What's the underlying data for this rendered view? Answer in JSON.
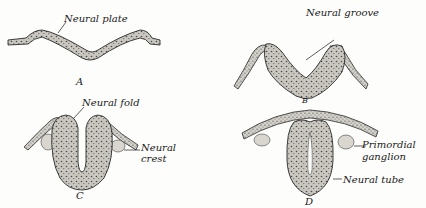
{
  "figures": [
    {
      "id": "A",
      "letter": "A",
      "labels": [
        "Neural plate"
      ]
    },
    {
      "id": "B",
      "letter": "B",
      "labels": [
        "Neural groove"
      ]
    },
    {
      "id": "C",
      "letter": "C",
      "labels": [
        "Neural fold",
        "Neural",
        "crest"
      ]
    },
    {
      "id": "D",
      "letter": "D",
      "labels": [
        "Primordial",
        "ganglion",
        "Neural tube"
      ]
    }
  ],
  "colors": {
    "tissue": "#b9b7b0",
    "outline": "#2a2a2a",
    "ink": "#1a1a1a"
  }
}
